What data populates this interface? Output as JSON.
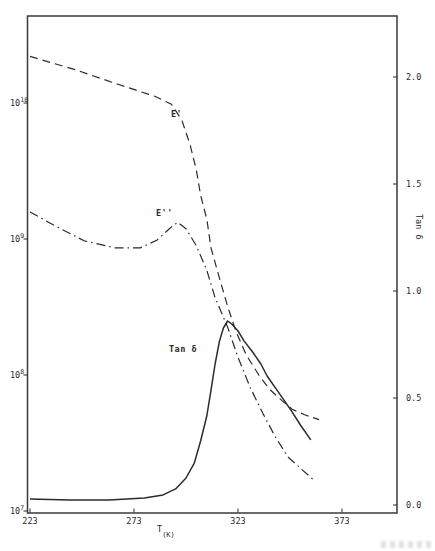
{
  "colors": {
    "ink": "#2b2b2b",
    "background": "#ffffff"
  },
  "chart_data": {
    "type": "line",
    "title": "",
    "grid": false,
    "legend_position": "inline-annotations",
    "x_axis": {
      "label_main": "T",
      "label_unit": "(K)",
      "range": [
        223,
        400
      ],
      "ticks": [
        {
          "label": "223",
          "value": 223
        },
        {
          "label": "273",
          "value": 273
        },
        {
          "label": "323",
          "value": 323
        },
        {
          "label": "373",
          "value": 373
        }
      ]
    },
    "y_left": {
      "label": "",
      "scale": "log",
      "range": [
        9500000.0,
        44000000000.0
      ],
      "ticks": [
        {
          "base": "10",
          "exponent": "7",
          "value": 10000000.0
        },
        {
          "base": "10",
          "exponent": "8",
          "value": 100000000.0
        },
        {
          "base": "10",
          "exponent": "9",
          "value": 1000000000.0
        },
        {
          "base": "10",
          "exponent": "10",
          "value": 10000000000.0
        }
      ]
    },
    "y_right": {
      "label": "Tan δ",
      "scale": "linear",
      "range": [
        -0.04,
        2.29
      ],
      "ticks": [
        {
          "label": "0.0",
          "value": 0.0
        },
        {
          "label": "0.5",
          "value": 0.5
        },
        {
          "label": "1.0",
          "value": 1.0
        },
        {
          "label": "1.5",
          "value": 1.5
        },
        {
          "label": "2.0",
          "value": 2.0
        }
      ]
    },
    "series": [
      {
        "id": "e-prime",
        "label": "E'",
        "axis": "left",
        "style": "dashed",
        "points": [
          [
            223,
            22000000000.0
          ],
          [
            245,
            17500000000.0
          ],
          [
            266,
            13600000000.0
          ],
          [
            283,
            11200000000.0
          ],
          [
            291,
            9800000000.0
          ],
          [
            296,
            7500000000.0
          ],
          [
            300,
            4900000000.0
          ],
          [
            303,
            3200000000.0
          ],
          [
            305,
            2100000000.0
          ],
          [
            308,
            1400000000.0
          ],
          [
            310,
            860000000.0
          ],
          [
            314,
            520000000.0
          ],
          [
            318,
            320000000.0
          ],
          [
            322,
            210000000.0
          ],
          [
            327,
            140000000.0
          ],
          [
            333,
            100000000.0
          ],
          [
            338,
            79000000.0
          ],
          [
            344,
            65000000.0
          ],
          [
            349,
            56000000.0
          ],
          [
            355,
            51000000.0
          ],
          [
            362,
            47000000.0
          ]
        ]
      },
      {
        "id": "e-double-prime",
        "label": "E''",
        "axis": "left",
        "style": "dashdot",
        "points": [
          [
            223,
            1580000000.0
          ],
          [
            235,
            1250000000.0
          ],
          [
            249,
            970000000.0
          ],
          [
            264,
            860000000.0
          ],
          [
            276,
            860000000.0
          ],
          [
            284,
            980000000.0
          ],
          [
            290,
            1190000000.0
          ],
          [
            294,
            1330000000.0
          ],
          [
            298,
            1190000000.0
          ],
          [
            303,
            890000000.0
          ],
          [
            308,
            590000000.0
          ],
          [
            312,
            370000000.0
          ],
          [
            318,
            225000000.0
          ],
          [
            323,
            135000000.0
          ],
          [
            329,
            80000000.0
          ],
          [
            335,
            52000000.0
          ],
          [
            341,
            35000000.0
          ],
          [
            347,
            25000000.0
          ],
          [
            354,
            20000000.0
          ],
          [
            360,
            16600000.0
          ]
        ]
      },
      {
        "id": "tan-delta",
        "label": "Tan δ",
        "axis": "right",
        "style": "solid",
        "points": [
          [
            223,
            0.028
          ],
          [
            242,
            0.023
          ],
          [
            261,
            0.023
          ],
          [
            278,
            0.033
          ],
          [
            287,
            0.047
          ],
          [
            293,
            0.075
          ],
          [
            298,
            0.126
          ],
          [
            302,
            0.196
          ],
          [
            305,
            0.299
          ],
          [
            308,
            0.416
          ],
          [
            310,
            0.537
          ],
          [
            312,
            0.659
          ],
          [
            314,
            0.762
          ],
          [
            316,
            0.827
          ],
          [
            318,
            0.86
          ],
          [
            320,
            0.846
          ],
          [
            323,
            0.813
          ],
          [
            326,
            0.766
          ],
          [
            330,
            0.715
          ],
          [
            334,
            0.659
          ],
          [
            337,
            0.603
          ],
          [
            341,
            0.547
          ],
          [
            345,
            0.491
          ],
          [
            349,
            0.435
          ],
          [
            353,
            0.374
          ],
          [
            358,
            0.304
          ]
        ]
      }
    ]
  }
}
